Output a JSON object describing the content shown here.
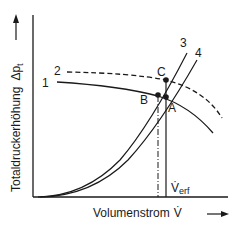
{
  "diagram": {
    "y_axis_label": "Totaldruckerhöhung",
    "y_axis_symbol": "Δp",
    "y_axis_symbol_sub": "t",
    "x_axis_label": "Volumenstrom",
    "x_axis_symbol": "V̇",
    "curve_labels": [
      "1",
      "2",
      "3",
      "4"
    ],
    "point_labels": {
      "a": "A",
      "b": "B",
      "c": "C"
    },
    "v_required_main": "V̇",
    "v_required_sub": "erf",
    "colors": {
      "line": "#1a1a1a",
      "background": "#ffffff"
    }
  }
}
